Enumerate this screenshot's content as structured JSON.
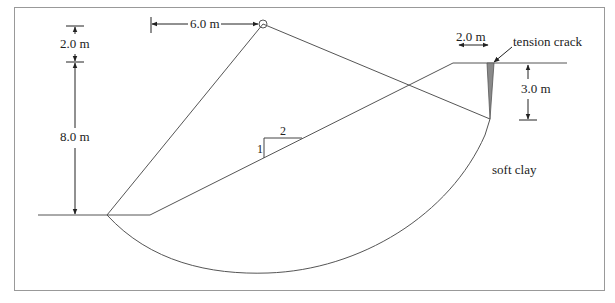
{
  "diagram": {
    "type": "slope stability section",
    "labels": {
      "height_upper": "2.0 m",
      "height_slope": "8.0 m",
      "center_offset": "6.0 m",
      "crack_offset": "2.0 m",
      "crack_label": "tension crack",
      "crack_depth": "3.0 m",
      "slope_rise": "1",
      "slope_run": "2",
      "soil": "soft clay"
    },
    "colors": {
      "line": "#555555",
      "frame": "#999999",
      "crack_fill": "#8a8a8a"
    }
  }
}
